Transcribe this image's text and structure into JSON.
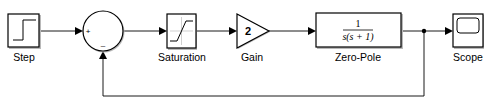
{
  "diagram": {
    "type": "simulink-block-diagram",
    "blocks": [
      {
        "id": "step",
        "label": "Step",
        "icon": "step-function-icon"
      },
      {
        "id": "sum",
        "label": "",
        "icon": "sum-circle-icon",
        "signs": [
          "+",
          "–"
        ]
      },
      {
        "id": "saturation",
        "label": "Saturation",
        "icon": "saturation-curve-icon"
      },
      {
        "id": "gain",
        "label": "Gain",
        "icon": "gain-triangle-icon",
        "value": "2"
      },
      {
        "id": "zero_pole",
        "label": "Zero-Pole",
        "icon": "transfer-function-icon",
        "numerator": "1",
        "denominator": "s(s + 1)"
      },
      {
        "id": "scope",
        "label": "Scope",
        "icon": "scope-screen-icon"
      }
    ],
    "connections": [
      {
        "from": "step",
        "to": "sum",
        "port": "+"
      },
      {
        "from": "sum",
        "to": "saturation"
      },
      {
        "from": "saturation",
        "to": "gain"
      },
      {
        "from": "gain",
        "to": "zero_pole"
      },
      {
        "from": "zero_pole",
        "to": "scope"
      },
      {
        "from": "zero_pole",
        "to": "sum",
        "port": "–",
        "type": "feedback"
      }
    ]
  }
}
